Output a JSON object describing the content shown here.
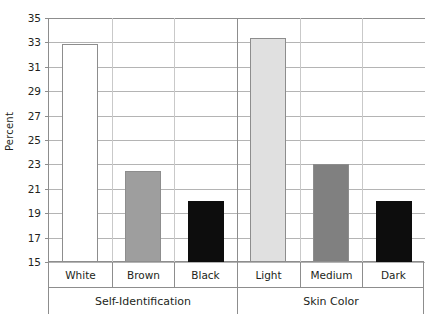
{
  "chart_data": {
    "type": "bar",
    "title": "",
    "xlabel": "",
    "ylabel": "Percent",
    "ylim": [
      15,
      35
    ],
    "ytick_step": 2,
    "yticks": [
      35,
      33,
      31,
      29,
      27,
      25,
      23,
      21,
      19,
      17,
      15
    ],
    "grid": true,
    "legend": false,
    "categories": [
      "White",
      "Brown",
      "Black",
      "Light",
      "Medium",
      "Dark"
    ],
    "values": [
      32.9,
      22.5,
      20.0,
      33.4,
      23.0,
      20.0
    ],
    "groups": [
      {
        "label": "Self-Identification",
        "categories": [
          "White",
          "Brown",
          "Black"
        ],
        "values": [
          32.9,
          22.5,
          20.0
        ]
      },
      {
        "label": "Skin Color",
        "categories": [
          "Light",
          "Medium",
          "Dark"
        ],
        "values": [
          33.4,
          23.0,
          20.0
        ]
      }
    ],
    "bars": [
      {
        "category": "White",
        "group": "Self-Identification",
        "value": 32.9,
        "color": "#ffffff"
      },
      {
        "category": "Brown",
        "group": "Self-Identification",
        "value": 22.5,
        "color": "#9e9e9e"
      },
      {
        "category": "Black",
        "group": "Self-Identification",
        "value": 20.0,
        "color": "#0d0d0d"
      },
      {
        "category": "Light",
        "group": "Skin Color",
        "value": 33.4,
        "color": "#e0e0e0"
      },
      {
        "category": "Medium",
        "group": "Skin Color",
        "value": 23.0,
        "color": "#808080"
      },
      {
        "category": "Dark",
        "group": "Skin Color",
        "value": 20.0,
        "color": "#0d0d0d"
      }
    ],
    "colors": {
      "white_bar": "#ffffff",
      "light_bar": "#e0e0e0",
      "brown_bar": "#9e9e9e",
      "medium_bar": "#808080",
      "black_bar": "#0d0d0d",
      "gridline": "#b4b4b4",
      "axis": "#8d8d8d",
      "text": "#231f20",
      "background": "#ffffff"
    }
  }
}
